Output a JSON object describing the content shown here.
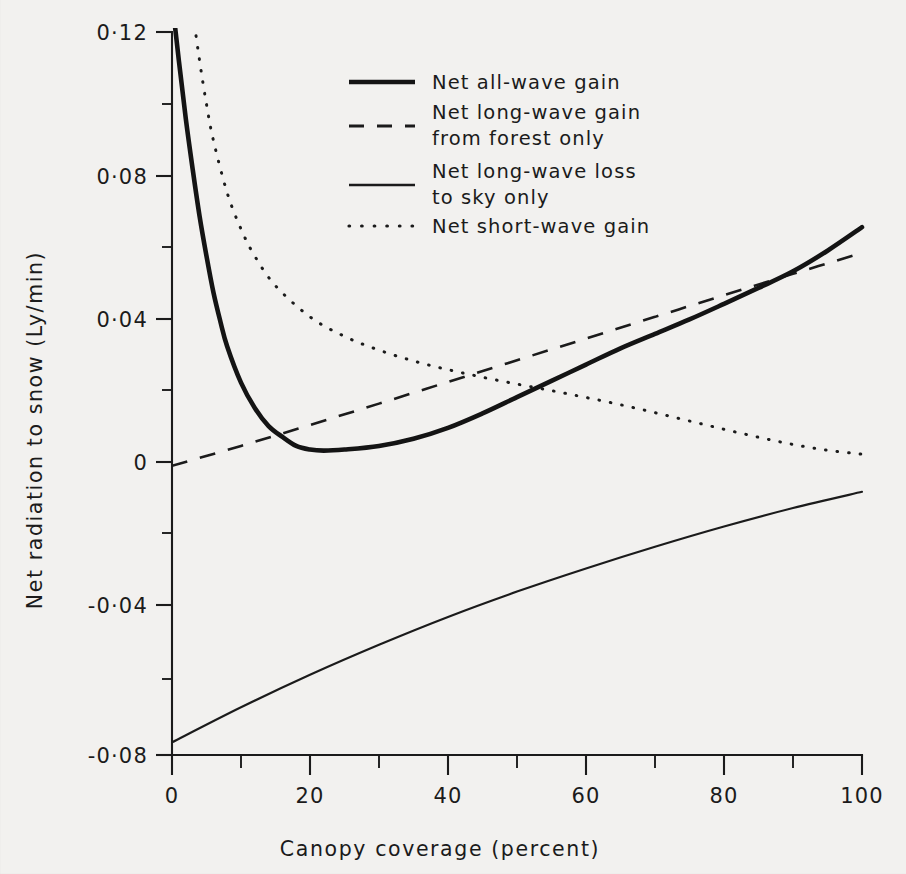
{
  "figure": {
    "background_color": "#f2f1ef",
    "ink_color": "#1b1b1b"
  },
  "chart_data": {
    "type": "line",
    "title": "",
    "xlabel": "Canopy coverage (percent)",
    "ylabel": "Net radiation to snow (Ly/min)",
    "xlim": [
      0,
      100
    ],
    "ylim": [
      -0.08,
      0.12
    ],
    "grid": false,
    "legend_position": "upper-center",
    "x_ticks": [
      0,
      20,
      40,
      60,
      80,
      100
    ],
    "x_tick_labels": [
      "0",
      "20",
      "40",
      "60",
      "80",
      "100"
    ],
    "x_minor_ticks": [
      10,
      30,
      50,
      70,
      90
    ],
    "y_ticks": [
      -0.08,
      -0.04,
      0,
      0.04,
      0.08,
      0.12
    ],
    "y_tick_labels": [
      "-0·08",
      "-0·04",
      "0",
      "0·04",
      "0·08",
      "0·12"
    ],
    "y_minor_ticks": [
      -0.06,
      -0.02,
      0.02,
      0.06,
      0.1
    ],
    "series": [
      {
        "name": "Net all-wave gain",
        "style": "solid-thick",
        "x": [
          0,
          1,
          2,
          3,
          4,
          5,
          6,
          7,
          8,
          10,
          12,
          14,
          16,
          18,
          20,
          22,
          25,
          30,
          35,
          40,
          45,
          50,
          55,
          60,
          65,
          70,
          75,
          80,
          85,
          90,
          95,
          100
        ],
        "y": [
          0.129,
          0.112,
          0.096,
          0.082,
          0.069,
          0.058,
          0.048,
          0.04,
          0.033,
          0.023,
          0.016,
          0.011,
          0.008,
          0.0055,
          0.0045,
          0.0042,
          0.0045,
          0.0055,
          0.0075,
          0.0105,
          0.0145,
          0.019,
          0.0235,
          0.028,
          0.0325,
          0.0365,
          0.0405,
          0.0448,
          0.0492,
          0.0538,
          0.0595,
          0.066
        ]
      },
      {
        "name": "Net long-wave gain from forest only",
        "style": "dashed",
        "x": [
          0,
          10,
          20,
          30,
          40,
          50,
          60,
          70,
          80,
          90,
          100
        ],
        "y": [
          0.0,
          0.0055,
          0.0113,
          0.0172,
          0.0232,
          0.0292,
          0.0352,
          0.0412,
          0.0472,
          0.0531,
          0.0589
        ]
      },
      {
        "name": "Net long-wave loss to sky only",
        "style": "solid-thin",
        "x": [
          0,
          10,
          20,
          30,
          40,
          50,
          60,
          70,
          80,
          90,
          100
        ],
        "y": [
          -0.0765,
          -0.0668,
          -0.0578,
          -0.0495,
          -0.0418,
          -0.0348,
          -0.0284,
          -0.0224,
          -0.0168,
          -0.0117,
          -0.0072
        ]
      },
      {
        "name": "Net short-wave gain",
        "style": "dotted",
        "x": [
          0,
          1,
          2,
          3,
          4,
          5,
          6,
          8,
          10,
          12,
          15,
          20,
          25,
          30,
          35,
          40,
          45,
          50,
          55,
          60,
          65,
          70,
          75,
          80,
          85,
          90,
          95,
          100
        ],
        "y": [
          0.186,
          0.163,
          0.143,
          0.126,
          0.112,
          0.1,
          0.09,
          0.0755,
          0.0655,
          0.058,
          0.0498,
          0.0412,
          0.0358,
          0.032,
          0.029,
          0.0266,
          0.0245,
          0.0226,
          0.0208,
          0.0189,
          0.0169,
          0.0147,
          0.0124,
          0.0101,
          0.0079,
          0.0059,
          0.0043,
          0.0032
        ]
      }
    ]
  },
  "legend": {
    "items": [
      {
        "label_line1": "Net all-wave gain",
        "label_line2": "",
        "style": "solid-thick"
      },
      {
        "label_line1": "Net long-wave gain",
        "label_line2": "from forest only",
        "style": "dashed"
      },
      {
        "label_line1": "Net long-wave loss",
        "label_line2": "to sky only",
        "style": "solid-thin"
      },
      {
        "label_line1": "Net short-wave gain",
        "label_line2": "",
        "style": "dotted"
      }
    ]
  }
}
